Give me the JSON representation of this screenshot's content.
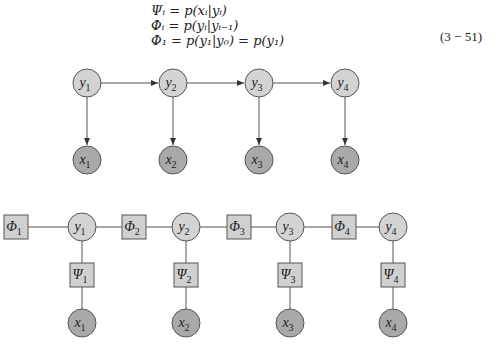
{
  "equations": [
    "Ψᵢ = p(xᵢ|yᵢ)",
    "Φᵢ = p(yᵢ|yᵢ₋₁)",
    "Φ₁ = p(y₁|y₀) = p(y₁)"
  ],
  "equation_number": "(3 − 51)",
  "hmm": {
    "hidden_nodes": [
      {
        "var": "y",
        "sub": "1"
      },
      {
        "var": "y",
        "sub": "2"
      },
      {
        "var": "y",
        "sub": "3"
      },
      {
        "var": "y",
        "sub": "4"
      }
    ],
    "observed_nodes": [
      {
        "var": "x",
        "sub": "1"
      },
      {
        "var": "x",
        "sub": "2"
      },
      {
        "var": "x",
        "sub": "3"
      },
      {
        "var": "x",
        "sub": "4"
      }
    ]
  },
  "factor_graph": {
    "hidden_nodes": [
      {
        "var": "y",
        "sub": "1"
      },
      {
        "var": "y",
        "sub": "2"
      },
      {
        "var": "y",
        "sub": "3"
      },
      {
        "var": "y",
        "sub": "4"
      }
    ],
    "observed_nodes": [
      {
        "var": "x",
        "sub": "1"
      },
      {
        "var": "x",
        "sub": "2"
      },
      {
        "var": "x",
        "sub": "3"
      },
      {
        "var": "x",
        "sub": "4"
      }
    ],
    "transition_factors": [
      {
        "var": "Φ",
        "sub": "1"
      },
      {
        "var": "Φ",
        "sub": "2"
      },
      {
        "var": "Φ",
        "sub": "3"
      },
      {
        "var": "Φ",
        "sub": "4"
      }
    ],
    "emission_factors": [
      {
        "var": "Ψ",
        "sub": "1"
      },
      {
        "var": "Ψ",
        "sub": "2"
      },
      {
        "var": "Ψ",
        "sub": "3"
      },
      {
        "var": "Ψ",
        "sub": "4"
      }
    ]
  },
  "colors": {
    "hidden_fill": "#d3d3d3",
    "observed_fill": "#a9a9a9",
    "factor_fill": "#d0d0d0",
    "stroke": "#555555"
  }
}
